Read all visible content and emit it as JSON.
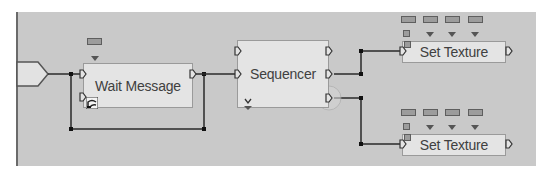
{
  "canvas": {
    "background": "#c9c9c9",
    "node_fill": "#e4e4e4",
    "wire_color": "#2a2a2a"
  },
  "event_trigger": {
    "icon": "event-input-arrow"
  },
  "nodes": [
    {
      "id": "wait_message",
      "label": "Wait Message",
      "inputs": 2,
      "outputs": 1,
      "variables": 1,
      "badge_icon": "latent-action-icon"
    },
    {
      "id": "sequencer",
      "label": "Sequencer",
      "inputs": 2,
      "outputs": 3,
      "variables": 0,
      "expand_icon": "add-output-chevron"
    },
    {
      "id": "set_texture_1",
      "label": "Set Texture",
      "inputs": 1,
      "outputs": 1,
      "variables": 4
    },
    {
      "id": "set_texture_2",
      "label": "Set Texture",
      "inputs": 1,
      "outputs": 1,
      "variables": 4
    }
  ],
  "connections": [
    {
      "from": "event_trigger",
      "to": "wait_message.in0"
    },
    {
      "from": "wait_message.out0",
      "to": "sequencer.in1"
    },
    {
      "from": "wait_message.out0",
      "to": "event_trigger (loop back)"
    },
    {
      "from": "sequencer.out1",
      "to": "set_texture_1.in0"
    },
    {
      "from": "sequencer.out2",
      "to": "set_texture_2.in0"
    }
  ]
}
